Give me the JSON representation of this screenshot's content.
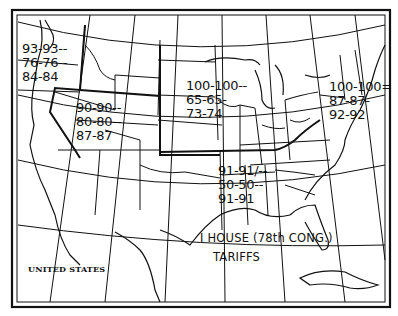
{
  "map": {
    "country_label": "UNITED STATES",
    "title_line1": "I HOUSE (78th CONG.)",
    "title_line2": "TARIFFS",
    "regions": [
      {
        "name": "pacific-northwest",
        "lines": [
          "93-93--",
          "76-76--",
          "84-84"
        ]
      },
      {
        "name": "mountain",
        "lines": [
          "90-90--",
          "80-80--",
          "87-87"
        ]
      },
      {
        "name": "midwest",
        "lines": [
          "100-100--",
          "65-65-",
          "73-74"
        ]
      },
      {
        "name": "northeast",
        "lines": [
          "100-100=",
          "87-87-",
          "92-92"
        ]
      },
      {
        "name": "south-central",
        "lines": [
          "91-91/--",
          "50-50--",
          "91-91"
        ]
      }
    ],
    "colors": {
      "ink": "#111111",
      "paper": "#ffffff"
    }
  }
}
